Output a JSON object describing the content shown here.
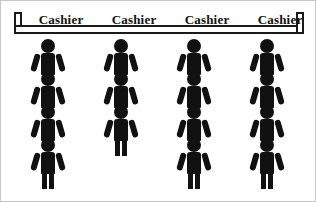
{
  "diagram": {
    "counter": {
      "name": "service-counter",
      "color": "#111111"
    },
    "stations": [
      {
        "label": "Cashier",
        "x": 5,
        "queue_length": 4
      },
      {
        "label": "Cashier",
        "x": 78,
        "queue_length": 3
      },
      {
        "label": "Cashier",
        "x": 151,
        "queue_length": 4
      },
      {
        "label": "Cashier",
        "x": 224,
        "queue_length": 4
      }
    ],
    "person_icon": "person-icon",
    "figure_color": "#111111",
    "background_color": "#ffffff",
    "border_color": "#c8c8c8"
  }
}
